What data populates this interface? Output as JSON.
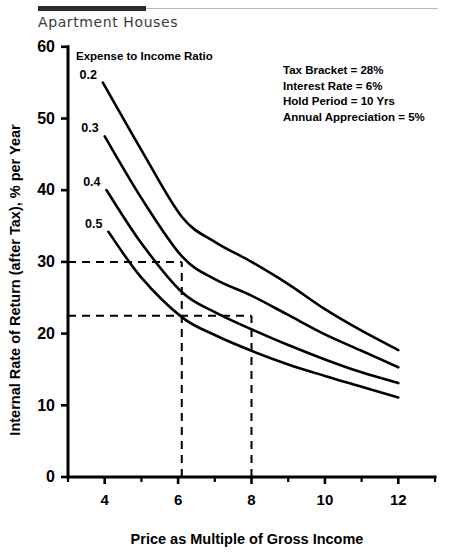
{
  "figure": {
    "title": "Apartment Houses"
  },
  "chart_data": {
    "type": "line",
    "title": "Apartment Houses",
    "xlabel": "Price as Multiple of Gross Income",
    "ylabel": "Internal Rate of Return (after Tax), % per Year",
    "legend_title": "Expense to Income Ratio",
    "legend_position": "inline-left-of-curves",
    "grid": false,
    "xlim": [
      3,
      13
    ],
    "ylim": [
      0,
      60
    ],
    "xticks": [
      4,
      6,
      8,
      10,
      12
    ],
    "xticks_minor": [
      3,
      5,
      7,
      9,
      11,
      13
    ],
    "yticks": [
      0,
      10,
      20,
      30,
      40,
      50,
      60
    ],
    "xtick_labels": [
      "4",
      "6",
      "8",
      "10",
      "12"
    ],
    "ytick_labels": [
      "0",
      "10",
      "20",
      "30",
      "40",
      "50",
      "60"
    ],
    "series": [
      {
        "name": "0.2",
        "label": "0.2",
        "x": [
          3.95,
          5.0,
          6.1,
          7.0,
          8.0,
          9.0,
          10.0,
          11.0,
          12.0
        ],
        "values": [
          55.0,
          45.6,
          36.3,
          32.8,
          30.0,
          26.9,
          23.4,
          20.4,
          17.7
        ]
      },
      {
        "name": "0.3",
        "label": "0.3",
        "x": [
          4.0,
          5.0,
          6.1,
          7.0,
          8.0,
          9.0,
          10.0,
          11.0,
          12.0
        ],
        "values": [
          47.5,
          38.9,
          30.8,
          27.6,
          25.3,
          22.6,
          19.9,
          17.6,
          15.3
        ]
      },
      {
        "name": "0.4",
        "label": "0.4",
        "x": [
          4.05,
          5.0,
          6.1,
          7.0,
          8.0,
          9.0,
          10.0,
          11.0,
          12.0
        ],
        "values": [
          40.0,
          32.6,
          25.8,
          23.0,
          20.6,
          18.4,
          16.4,
          14.6,
          13.1
        ]
      },
      {
        "name": "0.5",
        "label": "0.5",
        "x": [
          4.1,
          5.0,
          6.1,
          7.0,
          8.0,
          9.0,
          10.0,
          11.0,
          12.0
        ],
        "values": [
          34.2,
          27.8,
          22.3,
          19.8,
          17.6,
          15.7,
          14.1,
          12.6,
          11.1
        ]
      }
    ],
    "reference_lines": [
      {
        "name": "irr-30-horizontal",
        "orientation": "horizontal",
        "value": 30.0,
        "from_x": 3,
        "to_x": 6.1
      },
      {
        "name": "irr-22.5-horizontal",
        "orientation": "horizontal",
        "value": 22.5,
        "from_x": 3,
        "to_x": 8.0
      },
      {
        "name": "price-6.1-vertical",
        "orientation": "vertical",
        "value": 6.1,
        "from_y": 0,
        "to_y": 30.0
      },
      {
        "name": "price-8-vertical",
        "orientation": "vertical",
        "value": 8.0,
        "from_y": 0,
        "to_y": 22.5
      }
    ],
    "annotations": [
      "Tax Bracket = 28%",
      "Interest Rate = 6%",
      "Hold Period = 10 Yrs",
      "Annual Appreciation = 5%"
    ]
  },
  "colors": {
    "ink": "#000000",
    "title_text": "#3a3a3a",
    "rule_dark": "#2b2b2b",
    "rule_light": "#b9b9b9",
    "background": "#ffffff"
  }
}
